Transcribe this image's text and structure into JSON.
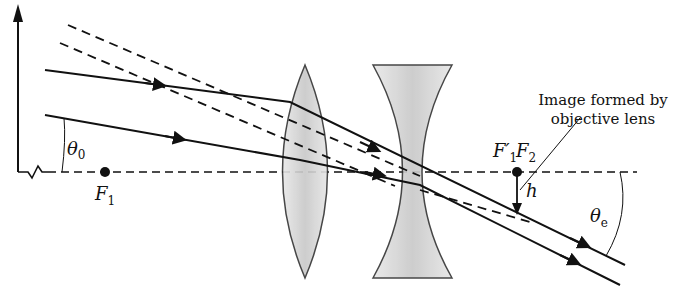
{
  "diagram": {
    "labels": {
      "theta_0_symbol": "θ",
      "theta_0_sub": "0",
      "F1_symbol": "F",
      "F1_sub": "1",
      "F1prime_symbol": "F′",
      "F1prime_sub": "1",
      "F2_symbol": "F",
      "F2_sub": "2",
      "h": "h",
      "theta_e_symbol": "θ",
      "theta_e_sub": "e"
    },
    "annotation": {
      "line1": "Image formed by",
      "line2": "objective lens"
    },
    "elements": [
      "distant-object-arrow",
      "optical-axis",
      "converging-objective-lens",
      "diverging-eyepiece-lens",
      "incoming-ray-upper",
      "incoming-ray-lower",
      "dashed-extension-upper",
      "dashed-extension-lower",
      "image-arrow-h"
    ],
    "colors": {
      "ink": "#111111",
      "lens_fill": "#d6d6d6",
      "background": "#ffffff"
    }
  }
}
